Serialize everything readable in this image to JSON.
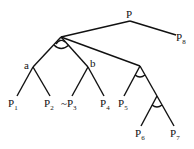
{
  "diagram": {
    "type": "and-or tree",
    "root": {
      "label": "P"
    },
    "nodes": [
      {
        "id": "root",
        "label": "P"
      },
      {
        "id": "n1",
        "label": "",
        "and_arc": true
      },
      {
        "id": "a",
        "label": "a"
      },
      {
        "id": "b",
        "label": "b"
      },
      {
        "id": "c",
        "label": "",
        "and_arc": true
      },
      {
        "id": "d",
        "label": "",
        "and_arc": true
      }
    ],
    "leaves": [
      {
        "base": "P",
        "sub": "1"
      },
      {
        "base": "P",
        "sub": "2"
      },
      {
        "base": "~P",
        "sub": "3"
      },
      {
        "base": "P",
        "sub": "4"
      },
      {
        "base": "P",
        "sub": "5"
      },
      {
        "base": "P",
        "sub": "6"
      },
      {
        "base": "P",
        "sub": "7"
      },
      {
        "base": "P",
        "sub": "8"
      }
    ],
    "edges": [
      [
        "root",
        "n1"
      ],
      [
        "root",
        "P8"
      ],
      [
        "n1",
        "a"
      ],
      [
        "n1",
        "b"
      ],
      [
        "n1",
        "c"
      ],
      [
        "a",
        "P1"
      ],
      [
        "a",
        "P2"
      ],
      [
        "b",
        "~P3"
      ],
      [
        "b",
        "P4"
      ],
      [
        "c",
        "P5"
      ],
      [
        "c",
        "d"
      ],
      [
        "d",
        "P6"
      ],
      [
        "d",
        "P7"
      ]
    ]
  }
}
